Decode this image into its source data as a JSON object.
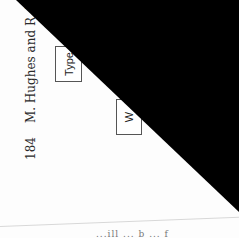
{
  "document": {
    "orientation": "rotated-90-ccw",
    "running_header": {
      "page_number": "184",
      "authors": "M. Hughes and R. Ba"
    },
    "diagram": {
      "boxes": [
        {
          "label": "Type"
        },
        {
          "label": "W"
        }
      ]
    },
    "body_text_fragment": "...ill ... b ... f",
    "overlay": {
      "shape": "triangle",
      "color": "#000000"
    }
  }
}
